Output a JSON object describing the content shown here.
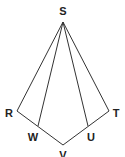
{
  "diagram": {
    "type": "geometry-figure",
    "points": {
      "S": {
        "label": "S",
        "x": 63,
        "y": 22,
        "lx": 63,
        "ly": 15
      },
      "R": {
        "label": "R",
        "x": 17,
        "y": 111,
        "lx": 9,
        "ly": 117
      },
      "T": {
        "label": "T",
        "x": 109,
        "y": 111,
        "lx": 116,
        "ly": 117
      },
      "W": {
        "label": "W",
        "x": 38,
        "y": 126,
        "lx": 33,
        "ly": 141
      },
      "U": {
        "label": "U",
        "x": 88,
        "y": 126,
        "lx": 91,
        "ly": 141
      },
      "V": {
        "label": "V",
        "x": 63,
        "y": 145,
        "lx": 63,
        "ly": 159
      }
    },
    "segments": [
      [
        "S",
        "R"
      ],
      [
        "S",
        "W"
      ],
      [
        "S",
        "U"
      ],
      [
        "S",
        "T"
      ],
      [
        "R",
        "V"
      ],
      [
        "V",
        "T"
      ]
    ],
    "colors": {
      "stroke": "#333333",
      "label": "#222222",
      "background": "#ffffff"
    }
  }
}
